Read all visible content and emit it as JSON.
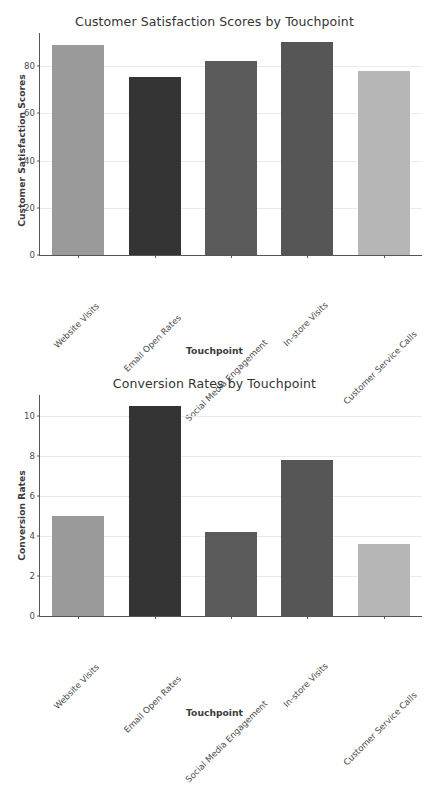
{
  "page": {
    "background_color": "#ffffff",
    "width": 429,
    "height": 715
  },
  "chart_data": [
    {
      "id": "customer-satisfaction",
      "type": "bar",
      "title": "Customer Satisfaction Scores by Touchpoint",
      "xlabel": "Touchpoint",
      "ylabel": "Customer Satisfaction Scores",
      "categories": [
        "Website Visits",
        "Email Open Rates",
        "Social Media Engagement",
        "In-store Visits",
        "Customer Service Calls"
      ],
      "values": [
        89.0,
        75.4,
        82.3,
        90.2,
        78.0
      ],
      "bar_colors": [
        "#9a9a9a",
        "#343434",
        "#5a5a5a",
        "#565656",
        "#b6b6b6"
      ],
      "ylim": [
        0,
        94
      ],
      "yticks": [
        0,
        20,
        40,
        60,
        80
      ],
      "ytick_labels": [
        "0",
        "20",
        "40",
        "60",
        "80"
      ],
      "grid": true,
      "grid_color": "#e9e9ee",
      "legend": "none"
    },
    {
      "id": "conversion-rates",
      "type": "bar",
      "title": "Conversion Rates by Touchpoint",
      "xlabel": "Touchpoint",
      "ylabel": "Conversion Rates",
      "categories": [
        "Website Visits",
        "Email Open Rates",
        "Social Media Engagement",
        "In-store Visits",
        "Customer Service Calls"
      ],
      "values": [
        5.0,
        10.5,
        4.2,
        7.8,
        3.6
      ],
      "bar_colors": [
        "#9a9a9a",
        "#343434",
        "#5a5a5a",
        "#565656",
        "#b6b6b6"
      ],
      "ylim": [
        0,
        11.05
      ],
      "yticks": [
        0,
        2,
        4,
        6,
        8,
        10
      ],
      "ytick_labels": [
        "0",
        "2",
        "4",
        "6",
        "8",
        "10"
      ],
      "grid": true,
      "grid_color": "#e9e9ee",
      "legend": "none"
    }
  ]
}
